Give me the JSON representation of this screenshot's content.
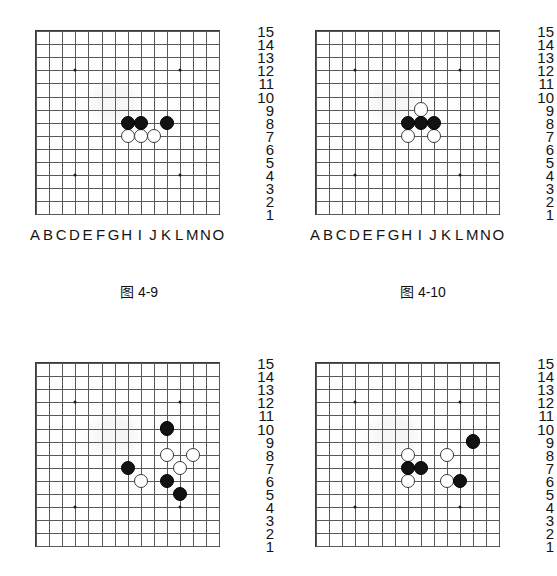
{
  "page": {
    "width": 557,
    "height": 576,
    "background": "#ffffff",
    "content_type": "go-board-diagrams",
    "colors": {
      "grid_line": "#595959",
      "board_border": "#3a3a3a",
      "black_stone": "#121212",
      "white_stone": "#ffffff",
      "white_stone_border": "#3b3b3b",
      "star_point": "#1a1a1a",
      "text": "#141414"
    }
  },
  "board_spec": {
    "size": 15,
    "column_labels": [
      "A",
      "B",
      "C",
      "D",
      "E",
      "F",
      "G",
      "H",
      "I",
      "J",
      "K",
      "L",
      "M",
      "N",
      "O"
    ],
    "row_labels": [
      "15",
      "14",
      "13",
      "12",
      "11",
      "10",
      "9",
      "8",
      "7",
      "6",
      "5",
      "4",
      "3",
      "2",
      "1"
    ],
    "star_points": [
      "D12",
      "L12",
      "D4",
      "L4"
    ]
  },
  "figures": [
    {
      "id": "figure-4-9",
      "caption": "图 4-9",
      "black_stones": [
        "H8",
        "I8",
        "K8"
      ],
      "white_stones": [
        "H7",
        "I7",
        "J7"
      ]
    },
    {
      "id": "figure-4-10",
      "caption": "图 4-10",
      "black_stones": [
        "H8",
        "I8",
        "J8"
      ],
      "white_stones": [
        "I9",
        "H7",
        "J7"
      ]
    },
    {
      "id": "figure-4-11",
      "caption": "",
      "black_stones": [
        "K10",
        "H7",
        "K6",
        "L5"
      ],
      "white_stones": [
        "K8",
        "M8",
        "L7",
        "I6"
      ]
    },
    {
      "id": "figure-4-12",
      "caption": "",
      "black_stones": [
        "M9",
        "H7",
        "I7",
        "L6"
      ],
      "white_stones": [
        "H8",
        "K8",
        "H6",
        "K6"
      ]
    }
  ]
}
